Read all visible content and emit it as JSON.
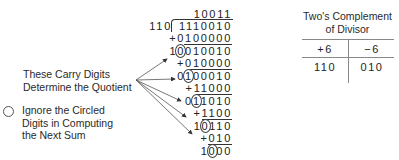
{
  "division": {
    "quotient": "10011",
    "divisor": "110",
    "dividend": "1110010",
    "steps": [
      {
        "kind": "add",
        "text": "+0100000"
      },
      {
        "kind": "sum",
        "pre": "1",
        "circled": "0",
        "post": "010010"
      },
      {
        "kind": "add",
        "text": "+010000"
      },
      {
        "kind": "sum",
        "pre": "0",
        "circled": "1",
        "post": "00010"
      },
      {
        "kind": "add",
        "text": "+11000"
      },
      {
        "kind": "sum",
        "pre": "0",
        "circled": "1",
        "post": "1010"
      },
      {
        "kind": "add",
        "text": "+1100"
      },
      {
        "kind": "sum",
        "pre": "1",
        "circled": "0",
        "post": "110"
      },
      {
        "kind": "add",
        "text": "+010"
      },
      {
        "kind": "sum",
        "pre": "1",
        "circled": "0",
        "post": "00"
      }
    ]
  },
  "annotations": {
    "carry_label_line1": "These Carry Digits",
    "carry_label_line2": "Determine the Quotient",
    "legend_line1": "Ignore the Circled",
    "legend_line2": "Digits in Computing",
    "legend_line3": "the Next Sum"
  },
  "table": {
    "title_line1": "Two's Complement",
    "title_line2": "of Divisor",
    "headers": [
      "+6",
      "−6"
    ],
    "values": [
      "110",
      "010"
    ]
  }
}
